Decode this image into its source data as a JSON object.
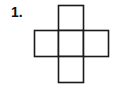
{
  "problem": {
    "number_label": "1."
  },
  "figure": {
    "type": "cross-net",
    "stroke_color": "#1a1a1a",
    "fill_color": "#ffffff",
    "squares": [
      {
        "name": "top",
        "x": 58,
        "y": 5,
        "w": 25,
        "h": 25
      },
      {
        "name": "left",
        "x": 34,
        "y": 30,
        "w": 24,
        "h": 26
      },
      {
        "name": "center",
        "x": 58,
        "y": 30,
        "w": 25,
        "h": 26
      },
      {
        "name": "right",
        "x": 83,
        "y": 30,
        "w": 25,
        "h": 26
      },
      {
        "name": "bottom",
        "x": 58,
        "y": 56,
        "w": 25,
        "h": 26
      }
    ]
  }
}
